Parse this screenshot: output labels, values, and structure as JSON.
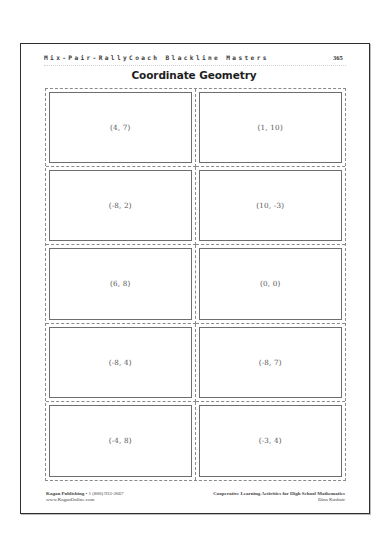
{
  "header": {
    "running_head": "Mix-Pair-RallyCoach Blackline Masters",
    "page_number": "365"
  },
  "title": "Coordinate Geometry",
  "cards": [
    {
      "label": "(4, 7)"
    },
    {
      "label": "(1, 10)"
    },
    {
      "label": "(-8, 2)"
    },
    {
      "label": "(10, -3)"
    },
    {
      "label": "(6, 8)"
    },
    {
      "label": "(0, 0)"
    },
    {
      "label": "(-8, 4)"
    },
    {
      "label": "(-8, 7)"
    },
    {
      "label": "(-4, 8)"
    },
    {
      "label": "(-3, 4)"
    }
  ],
  "footer": {
    "publisher": "Kagan Publishing",
    "separator": " • ",
    "phone": "1 (800) 933-2667",
    "website": "www.KaganOnline.com",
    "book_title": "Cooperative Learning Activities for High School Mathematics",
    "author": "Dina Kushnir"
  },
  "colors": {
    "page_border": "#2e2e2e",
    "cut_line": "#8a8a8a",
    "card_border": "#6e6e6e",
    "text": "#555555"
  }
}
